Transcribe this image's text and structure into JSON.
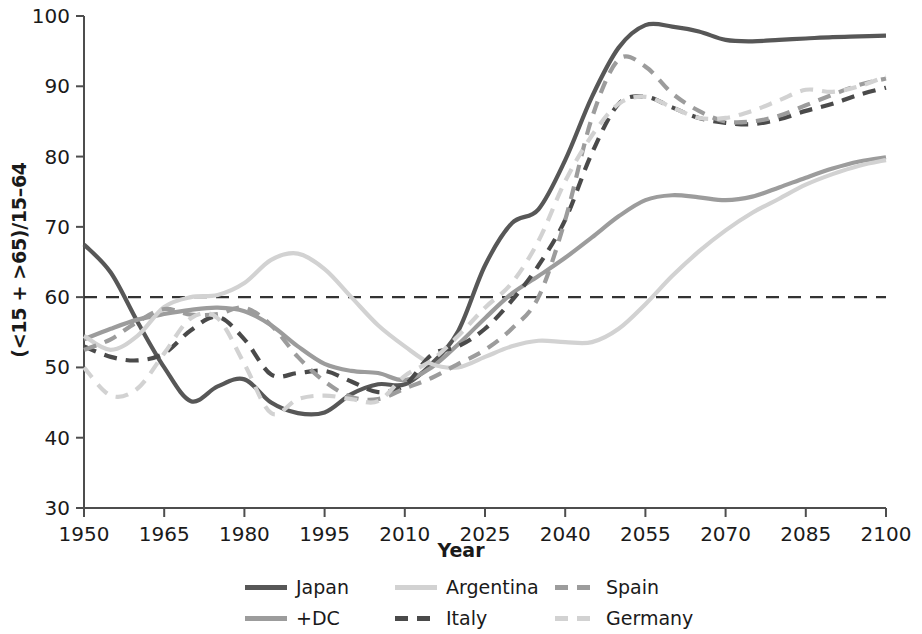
{
  "chart_data": {
    "type": "line",
    "title": "",
    "xlabel": "Year",
    "ylabel": "(<15 + >65)/15–64",
    "xlim": [
      1950,
      2100
    ],
    "ylim": [
      30,
      100
    ],
    "xticks": [
      1950,
      1965,
      1980,
      1995,
      2010,
      2025,
      2040,
      2055,
      2070,
      2085,
      2100
    ],
    "yticks": [
      30,
      40,
      50,
      60,
      70,
      80,
      90,
      100
    ],
    "grid": false,
    "legend_position": "below",
    "reference_line": {
      "value": 60,
      "style": "dashed",
      "color": "#333333"
    },
    "series": [
      {
        "name": "Japan",
        "color": "#575757",
        "style": "solid",
        "width": 4.2,
        "x": [
          1950,
          1955,
          1960,
          1965,
          1970,
          1975,
          1980,
          1985,
          1990,
          1995,
          2000,
          2005,
          2010,
          2015,
          2020,
          2025,
          2030,
          2035,
          2040,
          2045,
          2050,
          2055,
          2060,
          2065,
          2070,
          2075,
          2080,
          2085,
          2090,
          2095,
          2100
        ],
        "y": [
          67.5,
          63.5,
          56.5,
          50.0,
          45.2,
          47.3,
          48.3,
          45.0,
          43.5,
          43.6,
          46.2,
          47.6,
          47.6,
          50.5,
          55.2,
          64.5,
          70.5,
          72.5,
          79.5,
          88.5,
          95.5,
          98.7,
          98.5,
          97.8,
          96.6,
          96.4,
          96.6,
          96.8,
          97.0,
          97.1,
          97.2
        ]
      },
      {
        "name": "+DC",
        "color": "#9c9c9c",
        "style": "solid",
        "width": 4.2,
        "x": [
          1950,
          1955,
          1960,
          1965,
          1970,
          1975,
          1980,
          1985,
          1990,
          1995,
          2000,
          2005,
          2010,
          2015,
          2020,
          2025,
          2030,
          2035,
          2040,
          2045,
          2050,
          2055,
          2060,
          2065,
          2070,
          2075,
          2080,
          2085,
          2090,
          2095,
          2100
        ],
        "y": [
          54.0,
          55.5,
          56.8,
          57.6,
          58.2,
          58.5,
          58.0,
          56.0,
          53.0,
          50.5,
          49.5,
          49.2,
          48.2,
          50.0,
          53.3,
          57.0,
          60.5,
          63.0,
          65.6,
          68.5,
          71.5,
          73.8,
          74.5,
          74.2,
          73.8,
          74.3,
          75.6,
          77.0,
          78.3,
          79.3,
          79.9
        ]
      },
      {
        "name": "Argentina",
        "color": "#d2d2d2",
        "style": "solid",
        "width": 4.2,
        "x": [
          1950,
          1955,
          1960,
          1965,
          1970,
          1975,
          1980,
          1985,
          1990,
          1995,
          2000,
          2005,
          2010,
          2015,
          2020,
          2025,
          2030,
          2035,
          2040,
          2045,
          2050,
          2055,
          2060,
          2065,
          2070,
          2075,
          2080,
          2085,
          2090,
          2095,
          2100
        ],
        "y": [
          54.5,
          52.5,
          54.5,
          58.6,
          60.0,
          60.3,
          62.0,
          65.3,
          66.2,
          64.0,
          60.0,
          56.0,
          53.0,
          50.5,
          50.0,
          51.5,
          53.0,
          53.8,
          53.6,
          53.6,
          55.5,
          59.0,
          63.0,
          66.5,
          69.5,
          72.0,
          74.0,
          76.0,
          77.5,
          78.7,
          79.5
        ]
      },
      {
        "name": "Italy",
        "color": "#4a4a4a",
        "style": "dashed",
        "width": 4.2,
        "x": [
          1950,
          1955,
          1960,
          1965,
          1970,
          1975,
          1980,
          1985,
          1990,
          1995,
          2000,
          2005,
          2010,
          2015,
          2020,
          2025,
          2030,
          2035,
          2040,
          2045,
          2050,
          2055,
          2060,
          2065,
          2070,
          2075,
          2080,
          2085,
          2090,
          2095,
          2100
        ],
        "y": [
          53.0,
          51.5,
          51.0,
          52.0,
          55.3,
          57.2,
          54.0,
          49.0,
          49.2,
          49.5,
          48.0,
          46.5,
          47.5,
          51.8,
          53.0,
          55.5,
          59.5,
          64.5,
          71.0,
          80.5,
          87.5,
          88.5,
          87.0,
          85.5,
          84.8,
          84.6,
          85.3,
          86.5,
          87.5,
          88.8,
          89.8
        ]
      },
      {
        "name": "Spain",
        "color": "#9c9c9c",
        "style": "dashed",
        "width": 4.2,
        "x": [
          1950,
          1955,
          1960,
          1965,
          1970,
          1975,
          1980,
          1985,
          1990,
          1995,
          2000,
          2005,
          2010,
          2015,
          2020,
          2025,
          2030,
          2035,
          2040,
          2045,
          2050,
          2055,
          2060,
          2065,
          2070,
          2075,
          2080,
          2085,
          2090,
          2095,
          2100
        ],
        "y": [
          52.5,
          54.0,
          56.5,
          58.3,
          57.5,
          57.6,
          58.5,
          56.0,
          51.5,
          48.0,
          45.8,
          45.5,
          47.0,
          48.5,
          50.5,
          52.5,
          55.5,
          60.0,
          71.0,
          85.5,
          93.8,
          92.8,
          89.0,
          86.5,
          85.0,
          85.0,
          85.8,
          87.3,
          88.8,
          90.2,
          91.1
        ]
      },
      {
        "name": "Germany",
        "color": "#d2d2d2",
        "style": "dashed",
        "width": 4.2,
        "x": [
          1950,
          1955,
          1960,
          1965,
          1970,
          1975,
          1980,
          1985,
          1990,
          1995,
          2000,
          2005,
          2010,
          2015,
          2020,
          2025,
          2030,
          2035,
          2040,
          2045,
          2050,
          2055,
          2060,
          2065,
          2070,
          2075,
          2080,
          2085,
          2090,
          2095,
          2100
        ],
        "y": [
          50.0,
          46.0,
          47.0,
          52.0,
          57.0,
          57.0,
          50.5,
          43.5,
          45.5,
          46.0,
          45.5,
          45.2,
          48.8,
          51.0,
          54.5,
          58.5,
          62.0,
          68.0,
          76.5,
          83.0,
          87.5,
          88.5,
          87.0,
          85.5,
          85.5,
          86.5,
          88.0,
          89.5,
          89.2,
          90.0,
          91.4
        ]
      }
    ]
  },
  "axes": {
    "ylabel": "(<15 + >65)/15–64",
    "xlabel": "Year",
    "xtick_labels": [
      "1950",
      "1965",
      "1980",
      "1995",
      "2010",
      "2025",
      "2040",
      "2055",
      "2070",
      "2085",
      "2100"
    ],
    "ytick_labels": [
      "100",
      "90",
      "80",
      "70",
      "60",
      "50",
      "40",
      "30"
    ]
  },
  "legend": {
    "items": [
      {
        "label": "Japan",
        "color": "#575757",
        "style": "solid",
        "slot": "col1-row1"
      },
      {
        "label": "Argentina",
        "color": "#d2d2d2",
        "style": "solid",
        "slot": "col2-row1"
      },
      {
        "label": "Spain",
        "color": "#9c9c9c",
        "style": "dashed",
        "slot": "col3-row1"
      },
      {
        "label": "+DC",
        "color": "#9c9c9c",
        "style": "solid",
        "slot": "col1-row2"
      },
      {
        "label": "Italy",
        "color": "#4a4a4a",
        "style": "dashed",
        "slot": "col2-row2"
      },
      {
        "label": "Germany",
        "color": "#d2d2d2",
        "style": "dashed",
        "slot": "col3-row2"
      }
    ]
  }
}
